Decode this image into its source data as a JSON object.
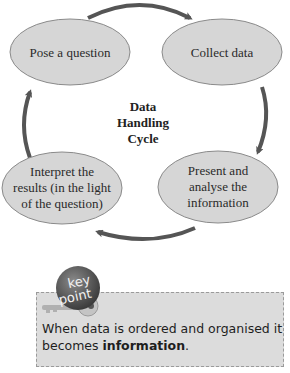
{
  "diagram": {
    "title_lines": [
      "Data",
      "Handling",
      "Cycle"
    ],
    "nodes": [
      {
        "id": "pose",
        "lines": [
          "Pose a question"
        ]
      },
      {
        "id": "collect",
        "lines": [
          "Collect data"
        ]
      },
      {
        "id": "present",
        "lines": [
          "Present and",
          "analyse the",
          "information"
        ]
      },
      {
        "id": "interpret",
        "lines": [
          "Interpret the",
          "results (in the light",
          "of the question)"
        ]
      }
    ],
    "colors": {
      "node_fill": "#d6d6d6",
      "node_stroke": "#8a8a8a",
      "arrow": "#555555"
    }
  },
  "key_point": {
    "badge_line1": "key",
    "badge_line2": "point",
    "text_before": "When data is ordered and organised it becomes ",
    "text_bold": "information",
    "text_after": "."
  }
}
